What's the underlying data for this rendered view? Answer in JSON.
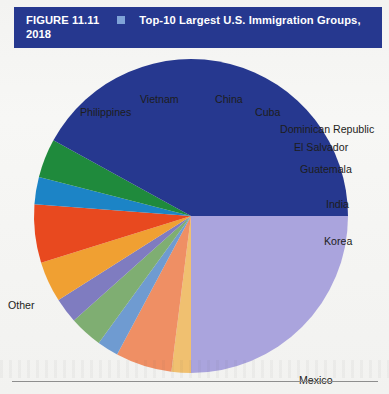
{
  "figure": {
    "number": "FIGURE 11.11",
    "separator_icon": "blue-square-bullet",
    "title_line1": "Top-10 Largest U.S. Immigration Groups,",
    "title_line2": "2018",
    "header_bg": "#26388f",
    "header_text_color": "#ffffff"
  },
  "chart_data": {
    "type": "pie",
    "title": "Top-10 Largest U.S. Immigration Groups, 2018",
    "xlabel": "",
    "ylabel": "",
    "legend_position": "none",
    "labels_placement": "outside-callout",
    "start_angle_deg": 90,
    "direction": "clockwise",
    "categories": [
      "Mexico",
      "India",
      "Korea",
      "Guatemala",
      "El Salvador",
      "Dominican Republic",
      "Cuba",
      "China",
      "Vietnam",
      "Philippines",
      "Other"
    ],
    "values": [
      25.0,
      5.8,
      2.0,
      2.2,
      3.4,
      2.6,
      4.2,
      6.0,
      2.8,
      4.0,
      42.0
    ],
    "unit": "percent",
    "colors": [
      "#aaa4dd",
      "#ef8f64",
      "#f0c070",
      "#6f9bd1",
      "#7fae72",
      "#7f7cc0",
      "#f0a032",
      "#e8491f",
      "#1c84c6",
      "#1f8a3c",
      "#26388f"
    ],
    "slices": [
      {
        "label": "Mexico",
        "value": 25.0,
        "color": "#aaa4dd"
      },
      {
        "label": "Korea",
        "value": 2.0,
        "color": "#f0c070"
      },
      {
        "label": "India",
        "value": 5.8,
        "color": "#ef8f64"
      },
      {
        "label": "Guatemala",
        "value": 2.2,
        "color": "#6f9bd1"
      },
      {
        "label": "El Salvador",
        "value": 3.4,
        "color": "#7fae72"
      },
      {
        "label": "Dominican Republic",
        "value": 2.6,
        "color": "#7f7cc0"
      },
      {
        "label": "Cuba",
        "value": 4.2,
        "color": "#f0a032"
      },
      {
        "label": "China",
        "value": 6.0,
        "color": "#e8491f"
      },
      {
        "label": "Vietnam",
        "value": 2.8,
        "color": "#1c84c6"
      },
      {
        "label": "Philippines",
        "value": 4.0,
        "color": "#1f8a3c"
      },
      {
        "label": "Other",
        "value": 42.0,
        "color": "#26388f"
      }
    ]
  },
  "labels": {
    "philippines": "Philippines",
    "vietnam": "Vietnam",
    "china": "China",
    "cuba": "Cuba",
    "dominican_republic": "Dominican Republic",
    "el_salvador": "El Salvador",
    "guatemala": "Guatemala",
    "india": "India",
    "korea": "Korea",
    "mexico": "Mexico",
    "other": "Other"
  }
}
